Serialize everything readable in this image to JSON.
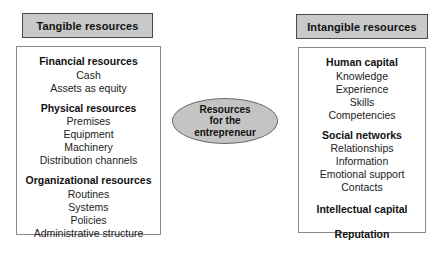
{
  "diagram": {
    "center_node": {
      "name": "resources-for-the-entrepreneur",
      "lines": [
        "Resources",
        "for the",
        "entrepreneur"
      ],
      "fill_color": "#c4c4c4",
      "border_color": "#6b6b6b",
      "shape": "ellipse"
    },
    "columns": [
      {
        "id": "tangible",
        "banner_label": "Tangible resources",
        "banner_fill": "#c9c9c9",
        "banner_border": "#4a4a4a",
        "groups": [
          {
            "title": "Financial resources",
            "items": [
              "Cash",
              "Assets as equity"
            ]
          },
          {
            "title": "Physical resources",
            "items": [
              "Premises",
              "Equipment",
              "Machinery",
              "Distribution channels"
            ]
          },
          {
            "title": "Organizational resources",
            "items": [
              "Routines",
              "Systems",
              "Policies",
              "Administrative structure"
            ]
          }
        ]
      },
      {
        "id": "intangible",
        "banner_label": "Intangible resources",
        "banner_fill": "#c9c9c9",
        "banner_border": "#4a4a4a",
        "groups": [
          {
            "title": "Human capital",
            "items": [
              "Knowledge",
              "Experience",
              "Skills",
              "Competencies"
            ]
          },
          {
            "title": "Social networks",
            "items": [
              "Relationships",
              "Information",
              "Emotional support",
              "Contacts"
            ]
          },
          {
            "title": "Intellectual capital",
            "items": []
          },
          {
            "title": "Reputation",
            "items": []
          }
        ]
      }
    ]
  }
}
